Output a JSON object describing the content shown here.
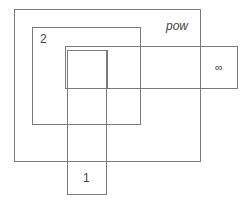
{
  "diagram": {
    "type": "nested-rectangles",
    "line_color": "#7a7a7a",
    "regions": [
      {
        "id": "pow",
        "label": "pow",
        "style": "italic"
      },
      {
        "id": "two",
        "label": "2"
      },
      {
        "id": "infinity",
        "label": "∞"
      },
      {
        "id": "one",
        "label": "1"
      },
      {
        "id": "inner-square",
        "label": ""
      }
    ]
  }
}
